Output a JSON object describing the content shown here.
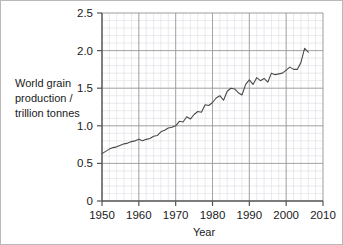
{
  "figure": {
    "border_color": "#b9b9b9",
    "background": "#ffffff"
  },
  "chart_data": {
    "type": "line",
    "title": "",
    "xlabel": "Year",
    "ylabel": "World grain production / trillion tonnes",
    "ylabel_lines": [
      "World grain",
      "production /",
      "trillion tonnes"
    ],
    "xlim": [
      1950,
      2010
    ],
    "ylim": [
      0,
      2.5
    ],
    "xticks": [
      1950,
      1960,
      1970,
      1980,
      1990,
      2000,
      2010
    ],
    "xtick_labels": [
      "1950",
      "1960",
      "1970",
      "1980",
      "1990",
      "2000",
      "2010"
    ],
    "yticks": [
      0,
      0.5,
      1.0,
      1.5,
      2.0,
      2.5
    ],
    "ytick_labels": [
      "0",
      "0.5",
      "1.0",
      "1.5",
      "2.0",
      "2.5"
    ],
    "grid": {
      "major": true,
      "minor": true,
      "major_color": "#9a9a9a",
      "minor_color": "#dcdce4",
      "x_minor_step": 2,
      "y_minor_step": 0.1
    },
    "legend": null,
    "line_color": "#4a4a4a",
    "line_width": 1.1,
    "series": [
      {
        "name": "World grain production",
        "units": "trillion tonnes",
        "x": [
          1950,
          1951,
          1952,
          1953,
          1954,
          1955,
          1956,
          1957,
          1958,
          1959,
          1960,
          1961,
          1962,
          1963,
          1964,
          1965,
          1966,
          1967,
          1968,
          1969,
          1970,
          1971,
          1972,
          1973,
          1974,
          1975,
          1976,
          1977,
          1978,
          1979,
          1980,
          1981,
          1982,
          1983,
          1984,
          1985,
          1986,
          1987,
          1988,
          1989,
          1990,
          1991,
          1992,
          1993,
          1994,
          1995,
          1996,
          1997,
          1998,
          1999,
          2000,
          2001,
          2002,
          2003,
          2004,
          2005,
          2006
        ],
        "values": [
          0.63,
          0.66,
          0.69,
          0.71,
          0.72,
          0.74,
          0.76,
          0.77,
          0.79,
          0.8,
          0.82,
          0.8,
          0.82,
          0.83,
          0.86,
          0.87,
          0.92,
          0.94,
          0.97,
          0.98,
          1.0,
          1.06,
          1.05,
          1.12,
          1.09,
          1.15,
          1.19,
          1.18,
          1.28,
          1.27,
          1.31,
          1.37,
          1.4,
          1.34,
          1.46,
          1.5,
          1.49,
          1.44,
          1.41,
          1.55,
          1.61,
          1.55,
          1.64,
          1.6,
          1.63,
          1.58,
          1.7,
          1.68,
          1.69,
          1.7,
          1.74,
          1.78,
          1.75,
          1.75,
          1.84,
          2.03,
          1.98
        ]
      }
    ]
  }
}
